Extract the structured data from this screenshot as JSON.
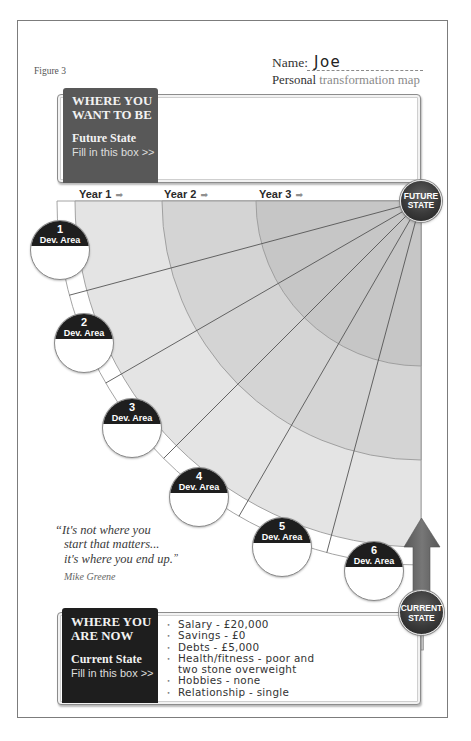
{
  "figure_label": "Figure 3",
  "header": {
    "name_label": "Name:",
    "name_value": "Joe",
    "subtitle_strong": "Personal",
    "subtitle_rest": "transformation map"
  },
  "future_box": {
    "title_line1": "WHERE YOU",
    "title_line2": "WANT TO BE",
    "state_label": "Future State",
    "instruction": "Fill in this box >>",
    "content": ""
  },
  "timeline": {
    "years": [
      {
        "label": "Year 1",
        "arrow": "➡"
      },
      {
        "label": "Year 2",
        "arrow": "➡"
      },
      {
        "label": "Year 3",
        "arrow": "➡"
      }
    ]
  },
  "map": {
    "future_state": {
      "line1": "FUTURE",
      "line2": "STATE"
    },
    "current_state": {
      "line1": "CURRENT",
      "line2": "STATE"
    },
    "dev_areas": [
      {
        "number": "1",
        "label": "Dev. Area"
      },
      {
        "number": "2",
        "label": "Dev. Area"
      },
      {
        "number": "3",
        "label": "Dev. Area"
      },
      {
        "number": "4",
        "label": "Dev. Area"
      },
      {
        "number": "5",
        "label": "Dev. Area"
      },
      {
        "number": "6",
        "label": "Dev. Area"
      }
    ]
  },
  "quote": {
    "open_mark": "“",
    "lines": [
      "It's not where you",
      "start that matters...",
      "it's where you end up."
    ],
    "close_mark": "”",
    "author": "Mike Greene"
  },
  "current_box": {
    "title_line1": "WHERE YOU",
    "title_line2": "ARE NOW",
    "state_label": "Current State",
    "instruction": "Fill in this box >>",
    "bullet": "•",
    "items": [
      {
        "lines": [
          "Salary - £20,000"
        ]
      },
      {
        "lines": [
          "Savings - £0"
        ]
      },
      {
        "lines": [
          "Debts - £5,000"
        ]
      },
      {
        "lines": [
          "Health/fitness - poor and",
          "two stone overweight"
        ]
      },
      {
        "lines": [
          "Hobbies - none"
        ]
      },
      {
        "lines": [
          "Relationship - single"
        ]
      }
    ]
  },
  "colors": {
    "future_label_bg": "#585858",
    "current_label_bg": "#1e1e1e",
    "outer_band": "#ffffff",
    "zone_year1": "#e4e4e4",
    "zone_year2": "#d4d4d4",
    "zone_year3": "#c6c6c6",
    "zone_border": "#9a9a9a",
    "path_line": "#555555",
    "arrow": "#676767"
  }
}
